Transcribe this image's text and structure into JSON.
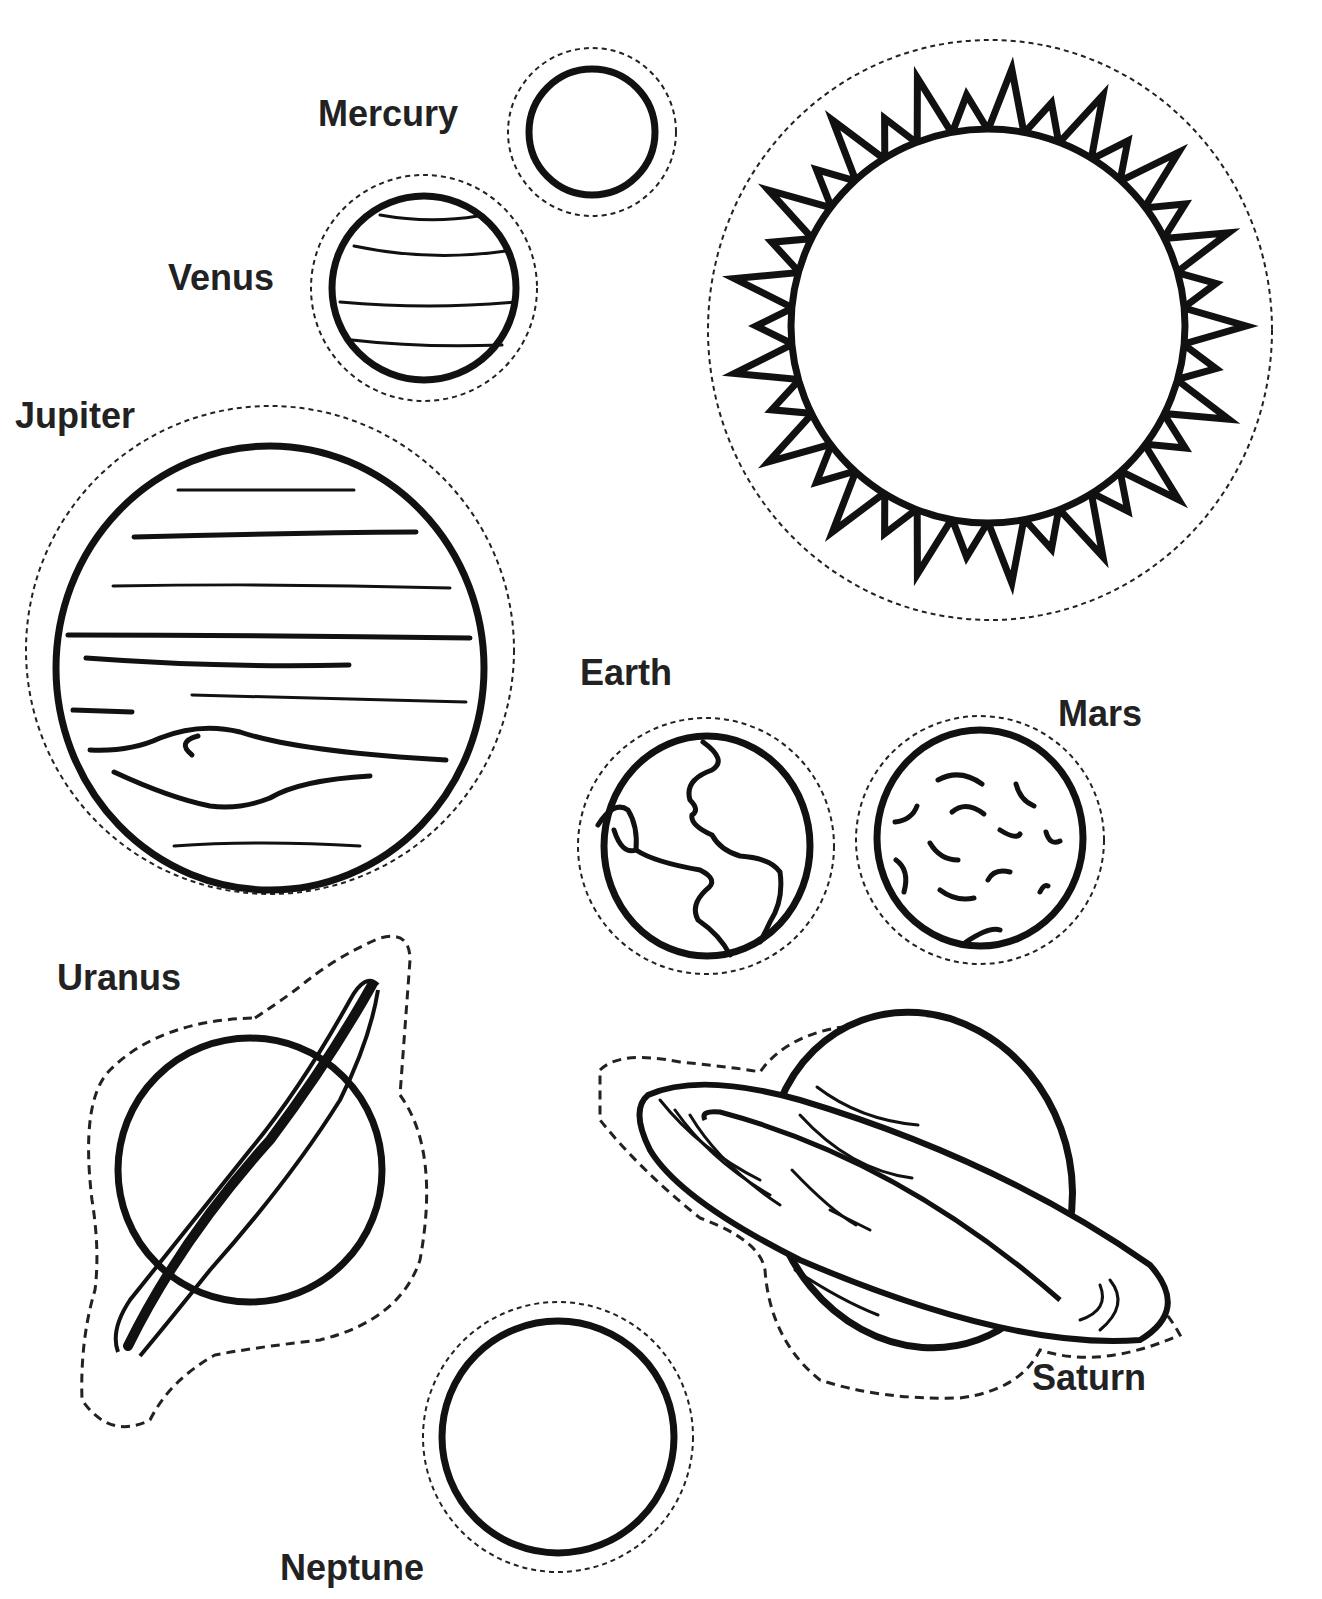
{
  "page": {
    "type": "solar-system-coloring-sheet",
    "ink_color": "#111111",
    "background": "#ffffff"
  },
  "labels": {
    "mercury": "Mercury",
    "venus": "Venus",
    "jupiter": "Jupiter",
    "earth": "Earth",
    "mars": "Mars",
    "uranus": "Uranus",
    "saturn": "Saturn",
    "neptune": "Neptune"
  },
  "bodies": [
    {
      "name": "Sun",
      "shape": "spiked-circle",
      "labeled": false
    },
    {
      "name": "Mercury",
      "shape": "plain-circle"
    },
    {
      "name": "Venus",
      "shape": "banded-circle"
    },
    {
      "name": "Jupiter",
      "shape": "banded-circle-with-spot"
    },
    {
      "name": "Earth",
      "shape": "continents-circle"
    },
    {
      "name": "Mars",
      "shape": "cratered-circle"
    },
    {
      "name": "Uranus",
      "shape": "ringed-tilted"
    },
    {
      "name": "Saturn",
      "shape": "ringed-banded"
    },
    {
      "name": "Neptune",
      "shape": "plain-circle"
    }
  ]
}
